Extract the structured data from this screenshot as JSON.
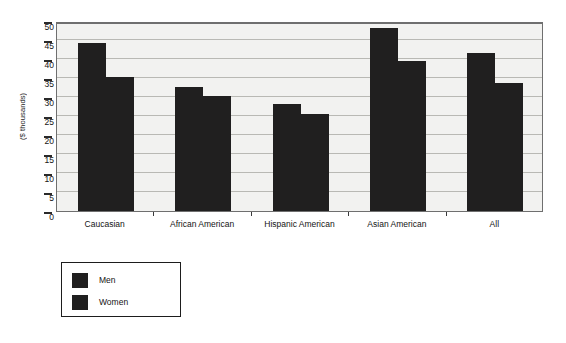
{
  "chart_data": {
    "type": "bar",
    "title": "",
    "subtitle": "",
    "xlabel": "",
    "ylabel": "($ thousands)",
    "categories": [
      "Caucasian",
      "African American",
      "Hispanic American",
      "Asian American",
      "All"
    ],
    "series": [
      {
        "name": "Men",
        "values": [
          44.2,
          32.6,
          28.1,
          48.2,
          41.5
        ]
      },
      {
        "name": "Women",
        "values": [
          35.2,
          30.2,
          25.6,
          39.6,
          33.7
        ]
      }
    ],
    "ylim": [
      0,
      50
    ],
    "yticks": [
      0,
      5,
      10,
      15,
      20,
      25,
      30,
      35,
      40,
      45,
      50
    ],
    "ytick_labels": [
      "0",
      "5",
      "10",
      "15",
      "20",
      "25",
      "30",
      "35",
      "40",
      "45",
      "50"
    ],
    "grid": true,
    "grid_axis": "y",
    "legend_position": "below-left",
    "legend_entries": [
      "Men",
      "Women"
    ],
    "bar_color": "#201f1f",
    "plot_background": "#f2f2f0",
    "grid_color": "#b9b9b4",
    "frame_color": "#6f6f6f"
  }
}
